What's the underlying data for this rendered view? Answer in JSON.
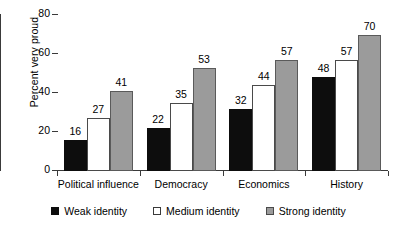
{
  "chart_data": {
    "type": "bar",
    "title": "",
    "subtitle": "",
    "xlabel": "",
    "ylabel": "Percent very proud",
    "ylim": [
      0,
      80
    ],
    "yticks": [
      0,
      20,
      40,
      60,
      80
    ],
    "ytick_labels": [
      "0",
      "20",
      "40",
      "60",
      "80"
    ],
    "grid": false,
    "legend_position": "bottom-center",
    "categories": [
      "Political influence",
      "Democracy",
      "Economics",
      "History"
    ],
    "series": [
      {
        "name": "Weak identity",
        "color": "#0d0d0d",
        "values": [
          16,
          22,
          32,
          48
        ],
        "value_labels": [
          "16",
          "22",
          "32",
          "48"
        ]
      },
      {
        "name": "Medium identity",
        "color": "#ffffff",
        "values": [
          27,
          35,
          44,
          57
        ],
        "value_labels": [
          "27",
          "35",
          "44",
          "57"
        ]
      },
      {
        "name": "Strong identity",
        "color": "#9b9b9b",
        "values": [
          41,
          53,
          57,
          70
        ],
        "value_labels": [
          "41",
          "53",
          "57",
          "70"
        ]
      }
    ]
  }
}
